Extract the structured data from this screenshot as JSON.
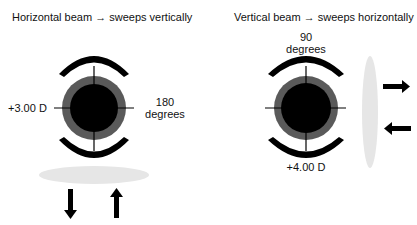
{
  "left_panel": {
    "title": "Horizontal beam → sweeps vertically",
    "power_label": "+3.00 D",
    "axis_label_line1": "180",
    "axis_label_line2": "degrees",
    "beam_orientation": "horizontal",
    "sweep_arrows": [
      "arrow-down",
      "arrow-up"
    ]
  },
  "right_panel": {
    "title": "Vertical beam → sweeps horizontally",
    "axis_label_line1": "90",
    "axis_label_line2": "degrees",
    "power_label": "+4.00 D",
    "beam_orientation": "vertical",
    "sweep_arrows": [
      "arrow-right",
      "arrow-left"
    ]
  },
  "colors": {
    "pupil": "#000000",
    "iris_ring": "#5a5a5a",
    "beam": "#e6e6e6",
    "arc": "#000000",
    "text": "#111111"
  }
}
